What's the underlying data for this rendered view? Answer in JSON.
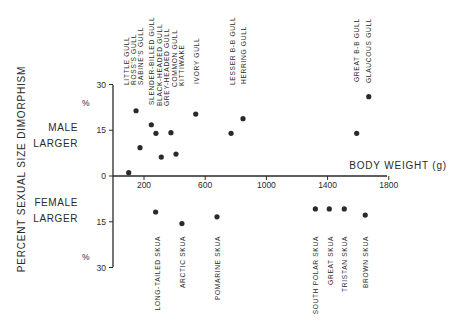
{
  "chart_data": {
    "type": "scatter",
    "title": "",
    "xlabel": "BODY WEIGHT (g)",
    "ylabel": "PERCENT SEXUAL SIZE DIMORPHISM",
    "xlim": [
      0,
      1800
    ],
    "ylim": [
      -30,
      30
    ],
    "x_ticks": [
      200,
      600,
      1000,
      1400,
      1800
    ],
    "y_ticks": [
      {
        "value": 30,
        "label": "30"
      },
      {
        "value": 15,
        "label": "15"
      },
      {
        "value": 0,
        "label": "0"
      },
      {
        "value": -15,
        "label": "15"
      },
      {
        "value": -30,
        "label": "30"
      }
    ],
    "y_unit_label": "%",
    "region_labels": {
      "upper": [
        "MALE",
        "LARGER"
      ],
      "lower": [
        "FEMALE",
        "LARGER"
      ]
    },
    "grid": false,
    "legend": null,
    "series": [
      {
        "name": "Gulls",
        "label_position": "top",
        "points": [
          {
            "label": "LITTLE GULL",
            "x": 100,
            "y": 1.1
          },
          {
            "label": "ROSS'S GULL",
            "x": 148,
            "y": 21.4
          },
          {
            "label": "SABINE'S GULL",
            "x": 174,
            "y": 9.3
          },
          {
            "label": "SLENDER-BILLED GULL",
            "x": 248,
            "y": 16.8
          },
          {
            "label": "BLACK-HEADED GULL",
            "x": 278,
            "y": 14.0
          },
          {
            "label": "GREY-HEADED GULL",
            "x": 313,
            "y": 6.2
          },
          {
            "label": "COMMON GULL",
            "x": 376,
            "y": 14.2
          },
          {
            "label": "KITTIWAKE",
            "x": 409,
            "y": 7.2
          },
          {
            "label": "IVORY GULL",
            "x": 538,
            "y": 20.3
          },
          {
            "label": "LESSER B-B GULL",
            "x": 769,
            "y": 14.0
          },
          {
            "label": "HERRING GULL",
            "x": 847,
            "y": 18.8
          },
          {
            "label": "GREAT B-B GULL",
            "x": 1590,
            "y": 14.0
          },
          {
            "label": "GLAUCOUS GULL",
            "x": 1669,
            "y": 26.0
          }
        ]
      },
      {
        "name": "Skuas",
        "label_position": "bottom",
        "points": [
          {
            "label": "LONG-TAILED SKUA",
            "x": 276,
            "y": -11.8
          },
          {
            "label": "ARCTIC SKUA",
            "x": 448,
            "y": -15.6
          },
          {
            "label": "POMARINE SKUA",
            "x": 677,
            "y": -13.4
          },
          {
            "label": "SOUTH POLAR SKUA",
            "x": 1320,
            "y": -10.8
          },
          {
            "label": "GREAT SKUA",
            "x": 1411,
            "y": -10.8
          },
          {
            "label": "TRISTAN SKUA",
            "x": 1509,
            "y": -10.8
          },
          {
            "label": "BROWN SKUA",
            "x": 1646,
            "y": -12.8
          }
        ]
      }
    ]
  },
  "top_labels": [
    {
      "text": "LITTLE GULL",
      "x": 127,
      "bottom": 85
    },
    {
      "text": "ROSS'S GULL",
      "x": 134,
      "bottom": 85
    },
    {
      "text": "SABINE'S GULL",
      "x": 141,
      "bottom": 85
    },
    {
      "text": "SLENDER-BILLED GULL",
      "x": 152,
      "bottom": 105
    },
    {
      "text": "BLACK-HEADED GULL",
      "x": 159.5,
      "bottom": 106
    },
    {
      "text": "GREY-HEADED GULL",
      "x": 167,
      "bottom": 106
    },
    {
      "text": "COMMON GULL",
      "x": 174.5,
      "bottom": 87
    },
    {
      "text": "KITTIWAKE",
      "x": 182,
      "bottom": 86
    },
    {
      "text": "IVORY GULL",
      "x": 197,
      "bottom": 84
    },
    {
      "text": "LESSER B-B GULL",
      "x": 233,
      "bottom": 85
    },
    {
      "text": "HERRING GULL",
      "x": 243.5,
      "bottom": 84
    },
    {
      "text": "GREAT B-B GULL",
      "x": 357,
      "bottom": 82
    },
    {
      "text": "GLAUCOUS GULL",
      "x": 369,
      "bottom": 83
    }
  ],
  "bottom_labels": [
    {
      "text": "LONG-TAILED SKUA",
      "x": 158,
      "top": 236
    },
    {
      "text": "ARCTIC SKUA",
      "x": 183,
      "top": 236
    },
    {
      "text": "POMARINE SKUA",
      "x": 218,
      "top": 236
    },
    {
      "text": "SOUTH POLAR SKUA",
      "x": 316,
      "top": 236
    },
    {
      "text": "GREAT SKUA",
      "x": 331,
      "top": 236
    },
    {
      "text": "TRISTAN SKUA",
      "x": 345,
      "top": 236
    },
    {
      "text": "BROWN SKUA",
      "x": 366,
      "top": 236
    }
  ],
  "colors": {
    "ink": "#2a2a2a",
    "background": "#ffffff"
  }
}
